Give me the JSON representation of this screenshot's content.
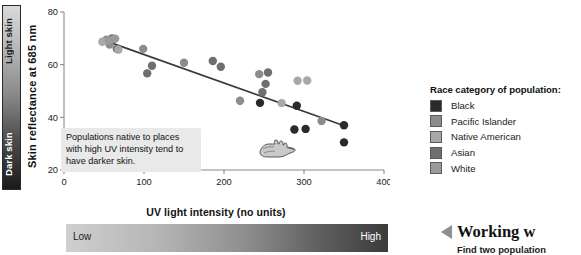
{
  "skin_bar": {
    "top_label": "Light skin",
    "bottom_label": "Dark skin"
  },
  "uv_bar": {
    "low_label": "Low",
    "high_label": "High"
  },
  "annotation": {
    "text": "Populations native to places with high UV intensity tend to have darker skin.",
    "pointer_icon": "pointing-hand-icon"
  },
  "legend": {
    "title": "Race category of population:",
    "items": [
      {
        "label": "Black",
        "color": "#2a2a2a"
      },
      {
        "label": "Pacific Islander",
        "color": "#8c8c8c"
      },
      {
        "label": "Native American",
        "color": "#a8a8a8"
      },
      {
        "label": "Asian",
        "color": "#6f6f6f"
      },
      {
        "label": "White",
        "color": "#9a9a9a"
      }
    ]
  },
  "working": {
    "arrow_icon": "left-triangle-icon",
    "title": "Working w",
    "subtitle": "Find two population"
  },
  "chart_data": {
    "type": "scatter",
    "title": "",
    "xlabel": "UV light intensity (no units)",
    "ylabel": "Skin reflectance at 685 nm",
    "xlim": [
      0,
      400
    ],
    "ylim": [
      20,
      80
    ],
    "xticks": [
      0,
      100,
      200,
      300,
      400
    ],
    "yticks": [
      20,
      40,
      60,
      80
    ],
    "grid": false,
    "legend_position": "right",
    "trendline": {
      "x": [
        45,
        352
      ],
      "y": [
        69.8,
        36.6
      ],
      "color": "#3a3a3a"
    },
    "series": [
      {
        "name": "Black",
        "color": "#2a2a2a",
        "points": [
          [
            245,
            45.5
          ],
          [
            291,
            44.4
          ],
          [
            350,
            37.0
          ],
          [
            288,
            35.4
          ],
          [
            302,
            35.6
          ],
          [
            350,
            30.5
          ]
        ]
      },
      {
        "name": "Asian",
        "color": "#6f6f6f",
        "points": [
          [
            252,
            52.7
          ],
          [
            248,
            49.5
          ],
          [
            255,
            57.0
          ],
          [
            186,
            61.4
          ],
          [
            196,
            59.2
          ],
          [
            110,
            59.6
          ],
          [
            104,
            56.7
          ],
          [
            60,
            70.0
          ],
          [
            66,
            66.0
          ]
        ]
      },
      {
        "name": "Pacific Islander",
        "color": "#8c8c8c",
        "points": [
          [
            150,
            60.7
          ],
          [
            220,
            46.3
          ],
          [
            244,
            56.4
          ],
          [
            322,
            38.6
          ],
          [
            99,
            66.0
          ],
          [
            53,
            69.5
          ],
          [
            62,
            69.8
          ],
          [
            57,
            67.6
          ]
        ]
      },
      {
        "name": "Native American",
        "color": "#a8a8a8",
        "points": [
          [
            292,
            53.9
          ],
          [
            304,
            54.0
          ],
          [
            272,
            45.4
          ],
          [
            48,
            68.7
          ],
          [
            68,
            65.7
          ]
        ]
      },
      {
        "name": "White",
        "color": "#9a9a9a",
        "points": [
          [
            56,
            69.2
          ],
          [
            64,
            69.9
          ]
        ]
      }
    ]
  }
}
